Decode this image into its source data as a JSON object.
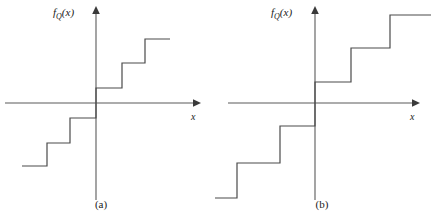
{
  "figure": {
    "background": "#ffffff",
    "line_color": "#4a4a4a",
    "axis_color": "#5a5a5a",
    "panels": [
      {
        "id": "a",
        "caption": "(a)",
        "y_axis_label_main": "f",
        "y_axis_label_sub": "Q",
        "y_axis_label_arg": "(x)",
        "x_axis_label": "x"
      },
      {
        "id": "b",
        "caption": "(b)",
        "y_axis_label_main": "f",
        "y_axis_label_sub": "Q",
        "y_axis_label_arg": "(x)",
        "x_axis_label": "x"
      }
    ]
  },
  "chart_data": [
    {
      "type": "line",
      "id": "a",
      "title": "",
      "subtitle": "(a)",
      "xlabel": "x",
      "ylabel": "f_Q(x)",
      "description": "Midrise uniform quantizer staircase transfer characteristic: odd-symmetric step function with no zero output level; steps cross the origin with a riser on the vertical axis.",
      "grid": false,
      "legend": null,
      "axis_origin": [
        96,
        103
      ],
      "xlim": [
        -96,
        101
      ],
      "ylim": [
        -97,
        95
      ],
      "step_width": 24,
      "step_height": 24,
      "symmetry": "odd",
      "num_steps_visible": 6,
      "x": [
        -74,
        -50,
        -50,
        -26,
        -26,
        0,
        0,
        26,
        26,
        50,
        50,
        74
      ],
      "y": [
        -63,
        -63,
        -40,
        -40,
        -15,
        -15,
        15,
        15,
        40,
        40,
        63,
        63
      ],
      "points_pixel": [
        [
          22,
          166
        ],
        [
          47,
          166
        ],
        [
          47,
          143
        ],
        [
          70,
          143
        ],
        [
          70,
          118
        ],
        [
          96,
          118
        ],
        [
          96,
          88
        ],
        [
          122,
          88
        ],
        [
          122,
          63
        ],
        [
          145,
          63
        ],
        [
          145,
          39
        ],
        [
          170,
          39
        ]
      ]
    },
    {
      "type": "line",
      "id": "b",
      "title": "",
      "subtitle": "(b)",
      "xlabel": "x",
      "ylabel": "f_Q(x)",
      "description": "Midtread-style uniform quantizer staircase transfer characteristic with wider steps and larger step heights; fewer, broader levels than panel (a).",
      "grid": false,
      "legend": null,
      "axis_origin": [
        315,
        103
      ],
      "xlim": [
        -100,
        106
      ],
      "ylim": [
        -95,
        95
      ],
      "step_width": 38,
      "step_height": 34,
      "symmetry": "odd",
      "num_steps_visible": 5,
      "x": [
        -100,
        -78,
        -78,
        -35,
        -35,
        0,
        0,
        36,
        36,
        75,
        75,
        116
      ],
      "y": [
        -95,
        -95,
        -60,
        -60,
        -23,
        -23,
        21,
        21,
        55,
        55,
        88,
        88
      ],
      "points_pixel": [
        [
          215,
          198
        ],
        [
          237,
          198
        ],
        [
          237,
          163
        ],
        [
          280,
          163
        ],
        [
          280,
          126
        ],
        [
          315,
          126
        ],
        [
          315,
          82
        ],
        [
          351,
          82
        ],
        [
          351,
          48
        ],
        [
          390,
          48
        ],
        [
          390,
          15
        ],
        [
          431,
          15
        ]
      ]
    }
  ]
}
